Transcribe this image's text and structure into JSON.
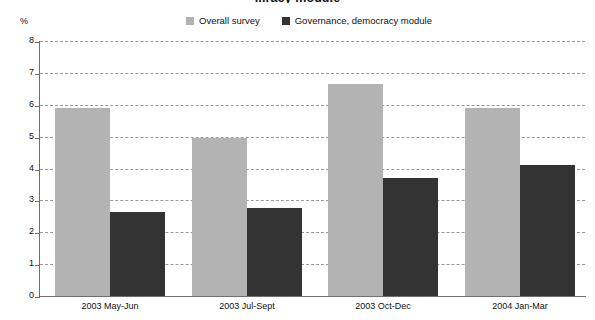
{
  "chart_data": {
    "type": "bar",
    "title": "...racy module",
    "ylabel": "%",
    "xlabel": "",
    "ylim": [
      0,
      8
    ],
    "yticks": [
      0,
      1,
      2,
      3,
      4,
      5,
      6,
      7,
      8
    ],
    "grid": true,
    "legend_position": "top-center",
    "categories": [
      "2003 May-Jun",
      "2003 Jul-Sept",
      "2003 Oct-Dec",
      "2004 Jan-Mar"
    ],
    "series": [
      {
        "name": "Overall survey",
        "color": "#b3b3b3",
        "values": [
          5.9,
          4.95,
          6.65,
          5.9
        ]
      },
      {
        "name": "Governance, democracy module",
        "color": "#333333",
        "values": [
          2.65,
          2.75,
          3.7,
          4.1
        ]
      }
    ]
  },
  "axis": {
    "unit_label": "%",
    "tick_labels": [
      "8",
      "7",
      "6",
      "5",
      "4",
      "3",
      "2",
      "1",
      "0"
    ]
  }
}
